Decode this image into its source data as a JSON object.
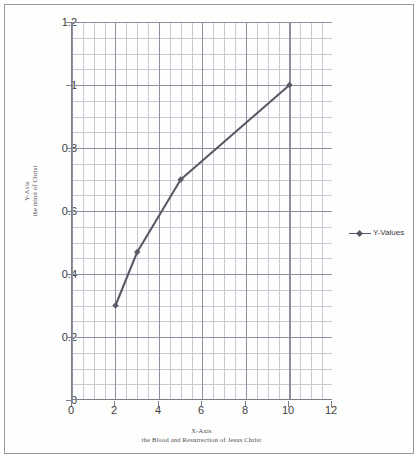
{
  "chart_data": {
    "type": "line",
    "title": "",
    "xlabel": "X-Axis",
    "xlabel_sub": "the Blood and Resurrection of Jesus Christ",
    "ylabel": "Y-Axis",
    "ylabel_sub": "the mind of Christ",
    "xlim": [
      0,
      12
    ],
    "ylim": [
      0,
      1.2
    ],
    "x_ticks": [
      "0",
      "2",
      "4",
      "6",
      "8",
      "10",
      "12"
    ],
    "y_ticks": [
      "0",
      "0.2",
      "0.4",
      "0.6",
      "0.8",
      "1",
      "1.2"
    ],
    "x_tick_values": [
      0,
      2,
      4,
      6,
      8,
      10,
      12
    ],
    "y_tick_values": [
      0,
      0.2,
      0.4,
      0.6,
      0.8,
      1,
      1.2
    ],
    "grid": true,
    "minor_grid": true,
    "legend_position": "right",
    "series": [
      {
        "name": "Y-Values",
        "color": "#5a5a66",
        "marker": "diamond",
        "x": [
          2,
          3,
          5,
          10
        ],
        "values": [
          0.3,
          0.47,
          0.7,
          1.0
        ]
      }
    ]
  },
  "legend": {
    "entry_label": "Y-Values"
  },
  "axes": {
    "y_title_line1": "Y-Axis",
    "y_title_line2": "the mind of Christ",
    "x_title_line1": "X-Axis",
    "x_title_line2": "the Blood and Resurrection of Jesus Christ"
  }
}
